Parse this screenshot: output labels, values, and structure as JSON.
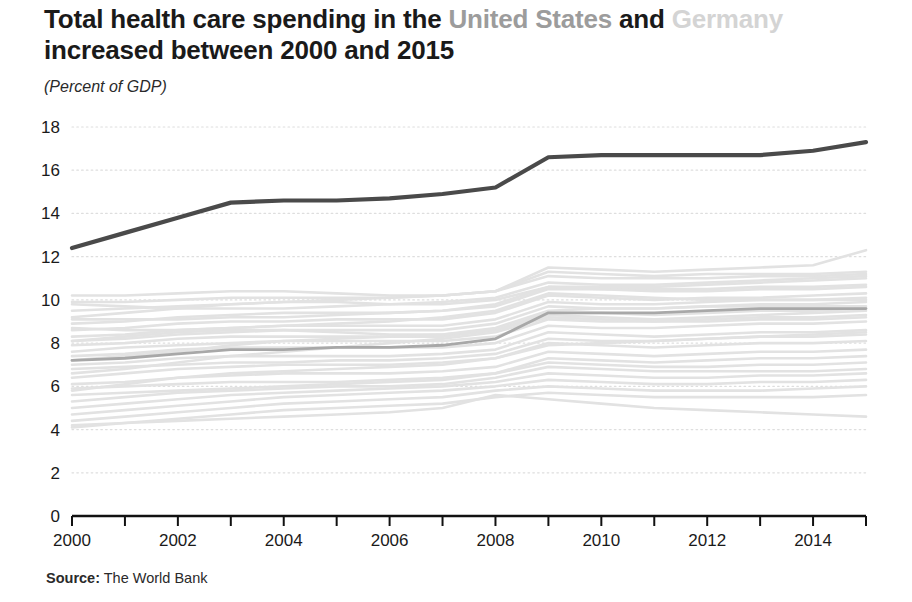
{
  "title": {
    "line1_part1": "Total health care spending in the ",
    "line1_highlight1": "United States",
    "line1_part2": " and ",
    "line1_highlight2": "Germany",
    "line2": "increased between 2000 and 2015"
  },
  "subtitle": "(Percent of GDP)",
  "source": {
    "label": "Source:",
    "text": " The World Bank"
  },
  "colors": {
    "united_states": "#4a4a4a",
    "germany": "#a8a8a8",
    "background_lines": "#e2e2e2",
    "gridline": "#dedede",
    "axis": "#111111",
    "text": "#1a1a1a"
  },
  "chart_data": {
    "type": "line",
    "title": "Total health care spending in the United States and Germany increased between 2000 and 2015",
    "subtitle": "(Percent of GDP)",
    "xlabel": "",
    "ylabel": "Percent of GDP",
    "xlim": [
      2000,
      2015
    ],
    "ylim": [
      0,
      18
    ],
    "yticks": [
      0,
      2,
      4,
      6,
      8,
      10,
      12,
      14,
      16,
      18
    ],
    "xticks": [
      2000,
      2001,
      2002,
      2003,
      2004,
      2005,
      2006,
      2007,
      2008,
      2009,
      2010,
      2011,
      2012,
      2013,
      2014,
      2015
    ],
    "xtick_labels": [
      "2000",
      "",
      "2002",
      "",
      "2004",
      "",
      "2006",
      "",
      "2008",
      "",
      "2010",
      "",
      "2012",
      "",
      "2014",
      ""
    ],
    "grid": "horizontal-dotted",
    "legend": "in-title",
    "x": [
      2000,
      2001,
      2002,
      2003,
      2004,
      2005,
      2006,
      2007,
      2008,
      2009,
      2010,
      2011,
      2012,
      2013,
      2014,
      2015
    ],
    "series": [
      {
        "name": "United States",
        "emphasis": "primary",
        "color": "#4a4a4a",
        "values": [
          12.4,
          13.1,
          13.8,
          14.5,
          14.6,
          14.6,
          14.7,
          14.9,
          15.2,
          16.6,
          16.7,
          16.7,
          16.7,
          16.7,
          16.9,
          17.3
        ]
      },
      {
        "name": "Germany",
        "emphasis": "secondary",
        "color": "#a8a8a8",
        "values": [
          7.2,
          7.3,
          7.5,
          7.7,
          7.7,
          7.8,
          7.8,
          7.9,
          8.2,
          9.4,
          9.4,
          9.4,
          9.5,
          9.6,
          9.6,
          9.6
        ]
      },
      {
        "name": "other-country-1",
        "emphasis": "background",
        "values": [
          9.9,
          9.9,
          10.0,
          10.1,
          10.1,
          10.1,
          10.1,
          10.2,
          10.4,
          11.1,
          11.0,
          11.0,
          11.0,
          11.1,
          11.1,
          11.2
        ]
      },
      {
        "name": "other-country-2",
        "emphasis": "background",
        "values": [
          9.5,
          9.6,
          9.7,
          9.8,
          9.9,
          10.0,
          10.1,
          10.2,
          10.4,
          11.3,
          11.2,
          11.1,
          11.2,
          11.2,
          11.2,
          11.3
        ]
      },
      {
        "name": "other-country-3",
        "emphasis": "background",
        "values": [
          9.2,
          9.4,
          9.6,
          9.8,
          9.9,
          9.9,
          9.8,
          9.8,
          10.0,
          10.6,
          10.6,
          10.6,
          10.7,
          10.8,
          10.9,
          11.0
        ]
      },
      {
        "name": "other-country-4",
        "emphasis": "background",
        "values": [
          8.9,
          9.0,
          9.2,
          9.3,
          9.4,
          9.4,
          9.4,
          9.5,
          9.7,
          10.5,
          10.5,
          10.5,
          10.5,
          10.6,
          10.6,
          10.7
        ]
      },
      {
        "name": "other-country-5",
        "emphasis": "background",
        "values": [
          8.6,
          8.7,
          8.9,
          9.0,
          9.0,
          9.1,
          9.1,
          9.1,
          9.4,
          10.2,
          10.1,
          10.0,
          10.1,
          10.1,
          10.2,
          10.3
        ]
      },
      {
        "name": "other-country-6",
        "emphasis": "background",
        "values": [
          8.3,
          8.4,
          8.6,
          8.7,
          8.8,
          8.8,
          8.8,
          8.8,
          9.1,
          9.9,
          9.8,
          9.8,
          9.9,
          10.0,
          10.0,
          10.1
        ]
      },
      {
        "name": "other-country-7",
        "emphasis": "background",
        "values": [
          8.1,
          8.2,
          8.4,
          8.5,
          8.6,
          8.6,
          8.6,
          8.6,
          8.9,
          9.7,
          9.6,
          9.6,
          9.7,
          9.8,
          9.8,
          9.9
        ]
      },
      {
        "name": "other-country-8",
        "emphasis": "background",
        "values": [
          7.9,
          8.0,
          8.2,
          8.3,
          8.3,
          8.3,
          8.3,
          8.3,
          8.6,
          9.4,
          9.4,
          9.3,
          9.4,
          9.5,
          9.5,
          9.6
        ]
      },
      {
        "name": "other-country-9",
        "emphasis": "background",
        "values": [
          7.6,
          7.8,
          7.9,
          8.0,
          8.1,
          8.1,
          8.1,
          8.1,
          8.3,
          9.1,
          9.0,
          9.0,
          9.1,
          9.2,
          9.2,
          9.3
        ]
      },
      {
        "name": "other-country-10",
        "emphasis": "background",
        "values": [
          7.4,
          7.5,
          7.7,
          7.8,
          7.8,
          7.8,
          7.8,
          7.8,
          8.0,
          8.8,
          8.7,
          8.7,
          8.8,
          8.9,
          8.9,
          9.0
        ]
      },
      {
        "name": "other-country-11",
        "emphasis": "background",
        "values": [
          8.1,
          8.3,
          8.5,
          8.6,
          8.6,
          8.5,
          8.4,
          8.4,
          8.6,
          9.3,
          9.2,
          9.1,
          9.2,
          9.3,
          9.4,
          9.5
        ]
      },
      {
        "name": "other-country-12",
        "emphasis": "background",
        "values": [
          7.0,
          7.1,
          7.3,
          7.4,
          7.4,
          7.4,
          7.4,
          7.5,
          7.7,
          8.5,
          8.4,
          8.3,
          8.4,
          8.5,
          8.5,
          8.6
        ]
      },
      {
        "name": "other-country-13",
        "emphasis": "background",
        "values": [
          6.8,
          6.9,
          7.0,
          7.1,
          7.1,
          7.2,
          7.2,
          7.3,
          7.5,
          8.2,
          8.1,
          8.1,
          8.2,
          8.3,
          8.3,
          8.4
        ]
      },
      {
        "name": "other-country-14",
        "emphasis": "background",
        "values": [
          10.2,
          10.2,
          10.3,
          10.4,
          10.4,
          10.3,
          10.2,
          10.2,
          10.4,
          11.5,
          11.4,
          11.3,
          11.4,
          11.5,
          11.6,
          12.3
        ]
      },
      {
        "name": "other-country-15",
        "emphasis": "background",
        "values": [
          6.4,
          6.6,
          6.8,
          6.9,
          7.0,
          7.0,
          7.0,
          7.1,
          7.3,
          8.0,
          7.9,
          7.8,
          7.9,
          8.0,
          8.0,
          8.1
        ]
      },
      {
        "name": "other-country-16",
        "emphasis": "background",
        "values": [
          6.1,
          6.2,
          6.4,
          6.5,
          6.6,
          6.6,
          6.6,
          6.7,
          6.9,
          7.6,
          7.5,
          7.4,
          7.5,
          7.6,
          7.6,
          7.7
        ]
      },
      {
        "name": "other-country-17",
        "emphasis": "background",
        "values": [
          5.9,
          6.0,
          6.1,
          6.2,
          6.2,
          6.2,
          6.3,
          6.4,
          6.6,
          7.3,
          7.2,
          7.1,
          7.2,
          7.3,
          7.3,
          7.4
        ]
      },
      {
        "name": "other-country-18",
        "emphasis": "background",
        "values": [
          5.6,
          5.7,
          5.8,
          5.9,
          6.0,
          6.1,
          6.2,
          6.3,
          6.6,
          7.1,
          7.0,
          6.9,
          6.9,
          7.0,
          7.0,
          7.1
        ]
      },
      {
        "name": "other-country-19",
        "emphasis": "background",
        "values": [
          5.3,
          5.5,
          5.7,
          5.8,
          5.9,
          6.0,
          6.0,
          6.1,
          6.4,
          6.9,
          6.8,
          6.7,
          6.7,
          6.7,
          6.7,
          6.8
        ]
      },
      {
        "name": "other-country-20",
        "emphasis": "background",
        "values": [
          5.0,
          5.2,
          5.4,
          5.6,
          5.7,
          5.8,
          5.9,
          6.0,
          6.2,
          6.6,
          6.5,
          6.4,
          6.4,
          6.5,
          6.5,
          6.6
        ]
      },
      {
        "name": "other-country-21",
        "emphasis": "background",
        "values": [
          4.7,
          4.9,
          5.1,
          5.3,
          5.5,
          5.6,
          5.7,
          5.8,
          6.0,
          6.3,
          6.2,
          6.1,
          6.1,
          6.2,
          6.2,
          6.3
        ]
      },
      {
        "name": "other-country-22",
        "emphasis": "background",
        "values": [
          4.4,
          4.6,
          4.8,
          5.0,
          5.2,
          5.3,
          5.4,
          5.5,
          5.8,
          6.0,
          5.9,
          5.8,
          5.8,
          5.8,
          5.9,
          6.0
        ]
      },
      {
        "name": "other-country-23",
        "emphasis": "background",
        "values": [
          4.1,
          4.3,
          4.5,
          4.7,
          4.9,
          5.0,
          5.1,
          5.2,
          5.5,
          5.7,
          5.6,
          5.5,
          5.5,
          5.5,
          5.5,
          5.6
        ]
      },
      {
        "name": "other-country-24",
        "emphasis": "background",
        "values": [
          4.2,
          4.3,
          4.4,
          4.5,
          4.6,
          4.7,
          4.8,
          5.0,
          5.6,
          5.4,
          5.2,
          5.0,
          4.9,
          4.8,
          4.7,
          4.6
        ]
      },
      {
        "name": "other-country-25",
        "emphasis": "background",
        "values": [
          8.7,
          8.6,
          8.6,
          8.7,
          8.8,
          8.9,
          9.0,
          9.2,
          9.5,
          10.3,
          10.2,
          10.1,
          10.0,
          10.0,
          10.0,
          10.0
        ]
      },
      {
        "name": "other-country-26",
        "emphasis": "background",
        "values": [
          7.2,
          7.4,
          7.6,
          7.9,
          8.1,
          8.2,
          8.3,
          8.4,
          8.7,
          9.5,
          9.6,
          9.6,
          9.7,
          9.7,
          9.7,
          9.7
        ]
      },
      {
        "name": "other-country-27",
        "emphasis": "background",
        "values": [
          6.6,
          6.8,
          7.1,
          7.4,
          7.6,
          7.8,
          8.0,
          8.2,
          8.5,
          9.2,
          9.1,
          9.0,
          9.0,
          9.1,
          9.1,
          9.2
        ]
      },
      {
        "name": "other-country-28",
        "emphasis": "background",
        "values": [
          9.8,
          9.7,
          9.6,
          9.6,
          9.6,
          9.7,
          9.8,
          9.9,
          10.1,
          10.8,
          10.7,
          10.7,
          10.8,
          10.9,
          11.0,
          11.1
        ]
      },
      {
        "name": "other-country-29",
        "emphasis": "background",
        "values": [
          5.8,
          6.1,
          6.4,
          6.6,
          6.7,
          6.8,
          6.9,
          7.0,
          7.3,
          7.9,
          8.0,
          8.1,
          8.2,
          8.3,
          8.4,
          8.5
        ]
      },
      {
        "name": "other-country-30",
        "emphasis": "background",
        "values": [
          9.1,
          9.1,
          9.1,
          9.2,
          9.2,
          9.3,
          9.4,
          9.5,
          9.8,
          10.6,
          10.5,
          10.4,
          10.4,
          10.5,
          10.5,
          10.6
        ]
      }
    ]
  }
}
